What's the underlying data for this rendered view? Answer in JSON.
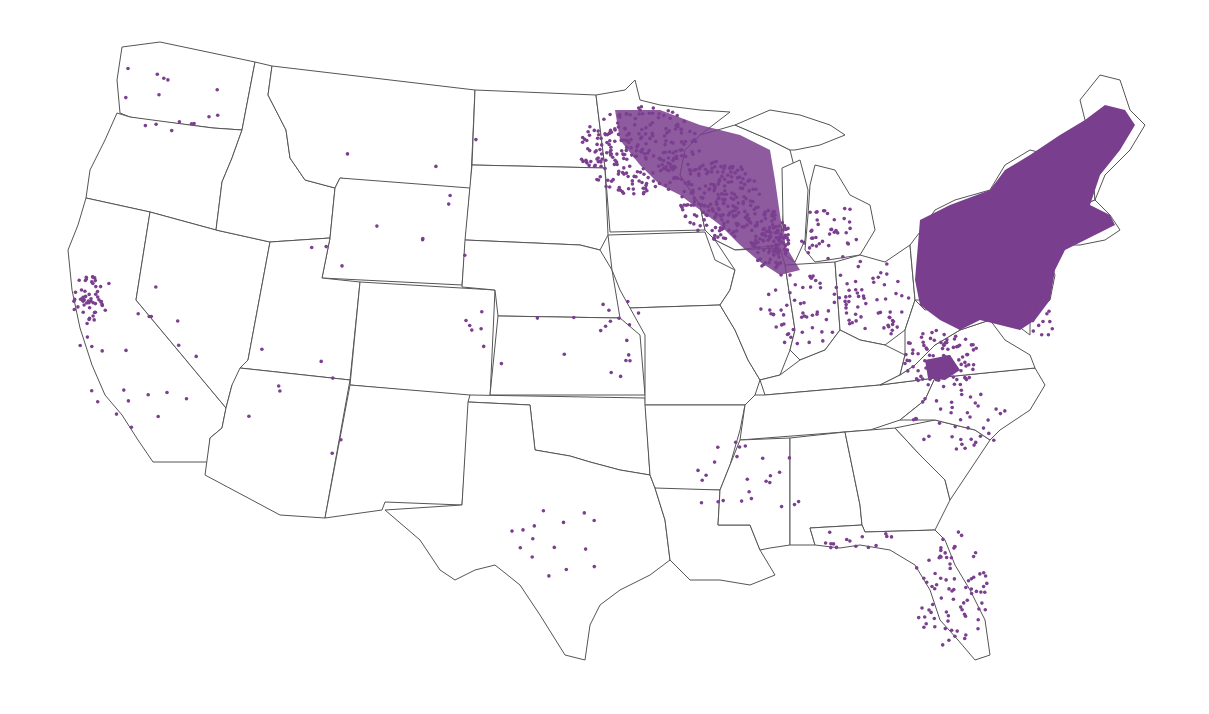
{
  "map": {
    "type": "dot-distribution",
    "region": "Contiguous United States",
    "base_fill": "#ffffff",
    "border_color": "#555555",
    "dot_color": "#7b3f8f",
    "legend": null,
    "title": null,
    "density_regions": [
      {
        "name": "Northeast / Mid-Atlantic",
        "density": "very high"
      },
      {
        "name": "Upper Midwest (MN, WI, MI, northern IL)",
        "density": "high"
      },
      {
        "name": "Ohio Valley / Appalachia",
        "density": "medium"
      },
      {
        "name": "Florida",
        "density": "low"
      },
      {
        "name": "Northern California coast",
        "density": "low"
      },
      {
        "name": "Texas",
        "density": "sparse"
      },
      {
        "name": "Great Plains / Mountain West",
        "density": "sparse"
      }
    ]
  }
}
